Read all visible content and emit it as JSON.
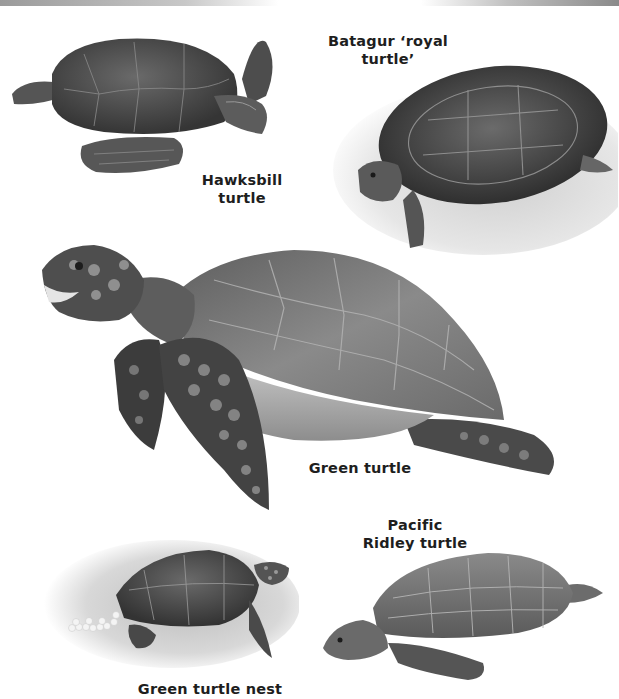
{
  "page": {
    "type": "illustrated encyclopedia page"
  },
  "illustrations": [
    {
      "id": "hawksbill",
      "label_lines": [
        "Hawksbill",
        "turtle"
      ]
    },
    {
      "id": "batagur",
      "label_lines": [
        "Batagur ‘royal",
        "turtle’"
      ]
    },
    {
      "id": "green",
      "label_lines": [
        "Green turtle"
      ]
    },
    {
      "id": "ridley",
      "label_lines": [
        "Pacific",
        "Ridley turtle"
      ]
    },
    {
      "id": "nest",
      "label_lines": [
        "Green turtle nest"
      ]
    }
  ],
  "colors": {
    "label_text": "#1e1e1e",
    "shell_dark": "#4a4a4a",
    "shell_mid": "#7a7a7a",
    "sand": "#d6d6d6",
    "eggs": "#f4f4f4"
  }
}
